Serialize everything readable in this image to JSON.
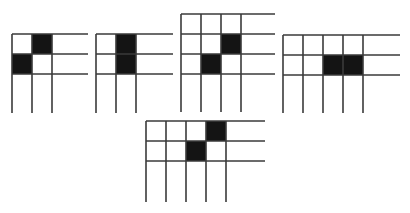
{
  "diagram": {
    "cell_size": 20,
    "colors": {
      "line": "#3a3a3a",
      "shaded": "#141414",
      "background": "#ffffff"
    },
    "grids": [
      {
        "id": "grid-1",
        "origin": [
          12,
          34
        ],
        "cols": 3,
        "rows": 3,
        "right": 88,
        "bottom": 113,
        "shaded": [
          [
            1,
            0
          ],
          [
            0,
            1
          ]
        ]
      },
      {
        "id": "grid-2",
        "origin": [
          96,
          34
        ],
        "cols": 3,
        "rows": 3,
        "right": 173,
        "bottom": 113,
        "shaded": [
          [
            1,
            0
          ],
          [
            1,
            1
          ]
        ]
      },
      {
        "id": "grid-3",
        "origin": [
          181,
          14
        ],
        "cols": 4,
        "rows": 4,
        "right": 275,
        "bottom": 112,
        "shaded": [
          [
            2,
            1
          ],
          [
            1,
            2
          ]
        ]
      },
      {
        "id": "grid-4",
        "origin": [
          283,
          35
        ],
        "cols": 5,
        "rows": 3,
        "right": 400,
        "bottom": 113,
        "shaded": [
          [
            2,
            1
          ],
          [
            3,
            1
          ]
        ]
      },
      {
        "id": "grid-5",
        "origin": [
          146,
          121
        ],
        "cols": 5,
        "rows": 3,
        "right": 265,
        "bottom": 202,
        "shaded": [
          [
            3,
            0
          ],
          [
            2,
            1
          ]
        ]
      }
    ]
  }
}
